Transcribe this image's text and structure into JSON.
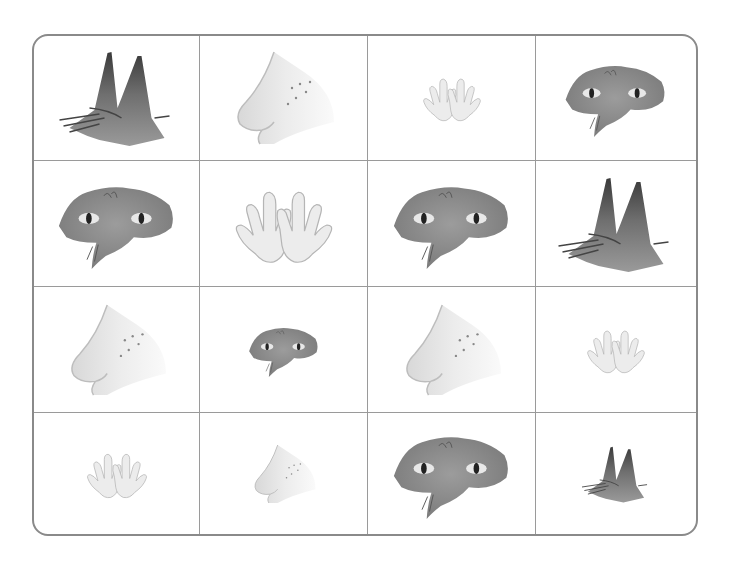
{
  "worksheet": {
    "title": "",
    "border_color": "#8a8a8a",
    "rows": 4,
    "columns": 4,
    "cells": [
      {
        "item": "ears",
        "size": "large"
      },
      {
        "item": "nose",
        "size": "large"
      },
      {
        "item": "hands",
        "size": "small"
      },
      {
        "item": "eyes",
        "size": "medium"
      },
      {
        "item": "eyes",
        "size": "large"
      },
      {
        "item": "hands",
        "size": "large"
      },
      {
        "item": "eyes",
        "size": "large"
      },
      {
        "item": "ears",
        "size": "large"
      },
      {
        "item": "nose",
        "size": "large"
      },
      {
        "item": "eyes",
        "size": "small"
      },
      {
        "item": "nose",
        "size": "large"
      },
      {
        "item": "hands",
        "size": "small"
      },
      {
        "item": "hands",
        "size": "small"
      },
      {
        "item": "nose",
        "size": "small"
      },
      {
        "item": "eyes",
        "size": "large"
      },
      {
        "item": "ears",
        "size": "small"
      }
    ]
  }
}
